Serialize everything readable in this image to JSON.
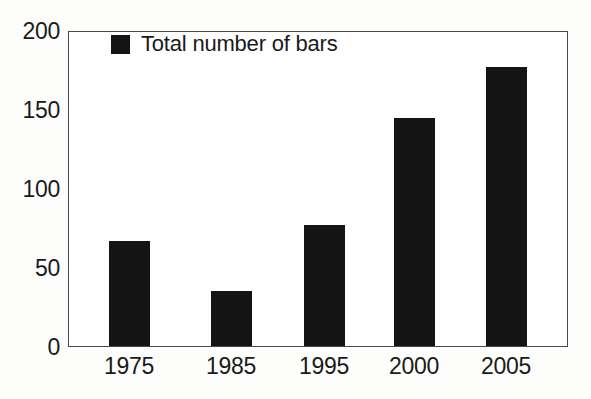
{
  "chart_data": {
    "type": "bar",
    "title": "",
    "subtitle": "",
    "xlabel": "",
    "ylabel": "",
    "categories": [
      "1975",
      "1985",
      "1995",
      "2000",
      "2005"
    ],
    "values": [
      67,
      35,
      77,
      145,
      178
    ],
    "series": [
      {
        "name": "Total number of bars",
        "values": [
          67,
          35,
          77,
          145,
          178
        ]
      }
    ],
    "ylim": [
      0,
      200
    ],
    "y_ticks": [
      "0",
      "50",
      "100",
      "150",
      "200"
    ],
    "y_tick_values": [
      0,
      50,
      100,
      150,
      200
    ],
    "grid": false,
    "legend_position": "inside-top-left",
    "legend_entries": [
      {
        "label": "Total number of bars",
        "color": "#141414"
      }
    ],
    "annotations": []
  },
  "legend": {
    "label": "Total number of bars",
    "swatch_name": "legend-color-swatch"
  },
  "colors": {
    "bar": "#141414",
    "axis": "#4a4a4a",
    "text": "#1a1a1a",
    "background": "#fdfdfc",
    "plot_background": "#ffffff"
  }
}
